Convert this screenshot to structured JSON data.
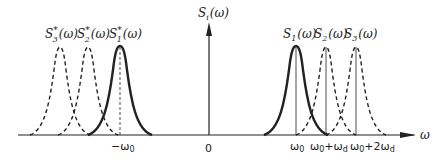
{
  "diagram": {
    "y_axis_label": {
      "base": "S",
      "sub": "i",
      "arg": "(ω)"
    },
    "x_axis_label": "ω",
    "origin_label": "0",
    "tick_labels": {
      "neg_w0": "−ω",
      "neg_w0_sub": "0",
      "w0": "ω",
      "w0_sub": "0",
      "w0_plus_wd": "ω",
      "w0_plus_wd_sub": "0",
      "w0_plus_wd_plus": "+ω",
      "w0_plus_wd_sub2": "d",
      "w0_plus_2wd": "ω",
      "w0_plus_2wd_sub": "0",
      "w0_plus_2wd_plus": "+2ω",
      "w0_plus_2wd_sub2": "d"
    },
    "curves_right": [
      {
        "base": "S",
        "sub": "1",
        "arg": "(ω)",
        "style": "solid"
      },
      {
        "base": "S",
        "sub": "2",
        "arg": "(ω)",
        "style": "dashed"
      },
      {
        "base": "S",
        "sub": "3",
        "arg": "(ω)",
        "style": "dashed"
      }
    ],
    "curves_left": [
      {
        "base": "S",
        "sup": "*",
        "sub": "3",
        "arg": "(ω)",
        "style": "dashed"
      },
      {
        "base": "S",
        "sup": "*",
        "sub": "2",
        "arg": "(ω)",
        "style": "dashed"
      },
      {
        "base": "S",
        "sup": "*",
        "sub": "1",
        "arg": "(ω)",
        "style": "solid"
      }
    ],
    "colors": {
      "ink": "#222222",
      "background": "#ffffff"
    }
  }
}
